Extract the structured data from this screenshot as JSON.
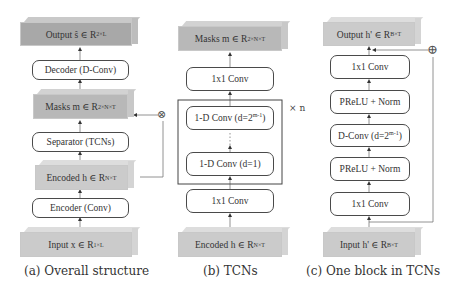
{
  "panel_a": {
    "caption": "(a) Overall structure",
    "output": {
      "label": "Output ŝ ∈ R",
      "sup": "2×L"
    },
    "decoder": {
      "label": "Decoder (D-Conv)"
    },
    "masks": {
      "label": "Masks m ∈ R",
      "sup": "2×N×T"
    },
    "separator": {
      "label": "Separator (TCNs)"
    },
    "encoded": {
      "label": "Encoded h ∈ R",
      "sup": "N×T"
    },
    "encoder": {
      "label": "Encoder (Conv)"
    },
    "input": {
      "label": "Input x ∈ R",
      "sup": "1×L"
    },
    "multiply_symbol": "⊗"
  },
  "panel_b": {
    "caption": "(b) TCNs",
    "masks": {
      "label": "Masks m ∈ R",
      "sup": "2×N×T"
    },
    "conv_top": {
      "label": "1x1 Conv"
    },
    "conv_dilated": {
      "label": "1-D Conv (d=2",
      "sup": "m-1",
      "suffix": ")"
    },
    "conv_d1": {
      "label": "1-D Conv (d=1)"
    },
    "conv_bottom": {
      "label": "1x1 Conv"
    },
    "encoded": {
      "label": "Encoded h ∈ R",
      "sup": "N×T"
    },
    "repeat_label": "× n",
    "ellipsis": "⋮"
  },
  "panel_c": {
    "caption": "(c) One block in TCNs",
    "output": {
      "label": "Output h' ∈ R",
      "sup": "B×T"
    },
    "conv_top": {
      "label": "1x1 Conv"
    },
    "prelu_top": {
      "label": "PReLU + Norm"
    },
    "dconv": {
      "label": "D-Conv (d=2",
      "sup": "m-1",
      "suffix": ")"
    },
    "prelu_bottom": {
      "label": "PReLU + Norm"
    },
    "conv_bottom": {
      "label": "1x1 Conv"
    },
    "input": {
      "label": "Input h' ∈ R",
      "sup": "B×T"
    },
    "add_symbol": "⊕"
  },
  "colors": {
    "line": "#555555",
    "box_border": "#4a4a4a",
    "tensor_dark": "#a8a8a8",
    "tensor_light": "#cbcbcb"
  }
}
